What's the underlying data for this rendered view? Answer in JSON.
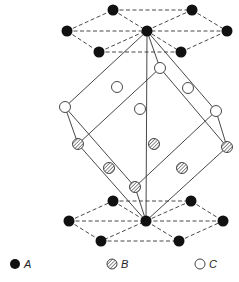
{
  "colors": {
    "background": "#ffffff",
    "line": "#333333",
    "atom_a_fill": "#111111",
    "atom_b_fill": "#cccccc",
    "atom_c_fill": "#ffffff"
  },
  "legend": {
    "items": [
      {
        "symbol": "solid-black-circle",
        "label": "A",
        "x": 15,
        "y": 264
      },
      {
        "symbol": "hatched-circle",
        "label": "B",
        "x": 112,
        "y": 264
      },
      {
        "symbol": "open-circle",
        "label": "C",
        "x": 200,
        "y": 264
      }
    ]
  },
  "diagram": {
    "type": "crystal-structure",
    "top_layer_a": [
      [
        113,
        10
      ],
      [
        192,
        10
      ],
      [
        67,
        31
      ],
      [
        147,
        31
      ],
      [
        227,
        31
      ],
      [
        99,
        52
      ],
      [
        181,
        52
      ]
    ],
    "bottom_layer_a": [
      [
        113,
        201
      ],
      [
        191,
        201
      ],
      [
        69,
        221
      ],
      [
        146,
        221
      ],
      [
        223,
        221
      ],
      [
        101,
        241
      ],
      [
        179,
        241
      ]
    ],
    "cell_vertices": {
      "top": [
        147,
        31
      ],
      "bottom": [
        146,
        221
      ],
      "c_upper": [
        [
          65,
          107
        ],
        [
          160,
          68
        ],
        [
          216,
          111
        ]
      ],
      "b_lower": [
        [
          78,
          144
        ],
        [
          135,
          187
        ],
        [
          227,
          147
        ]
      ]
    },
    "interior_c": [
      [
        117,
        87
      ],
      [
        188,
        88
      ],
      [
        140,
        109
      ]
    ],
    "interior_b": [
      [
        154,
        144
      ],
      [
        109,
        168
      ],
      [
        182,
        168
      ]
    ]
  }
}
